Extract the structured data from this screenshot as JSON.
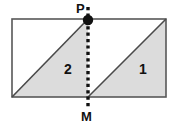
{
  "figure": {
    "type": "geometry-diagram",
    "background_color": "#ffffff",
    "stroke_color": "#4a4a4a",
    "shade_color": "#dcdcdc",
    "dot_color": "#111111",
    "labels": {
      "point_top": "P",
      "point_bottom": "M",
      "region_left": "2",
      "region_right": "1"
    },
    "geometry": {
      "rectangle": {
        "x": 12,
        "y": 19,
        "width": 154,
        "height": 78
      },
      "midline_x": 88,
      "point_P": {
        "x": 88,
        "y": 19
      },
      "point_M": {
        "x": 88,
        "y": 97
      },
      "dotted_line": {
        "x": 88,
        "y_top": 6,
        "y_bottom": 110
      },
      "diagonal_left": {
        "x1": 12,
        "y1": 97,
        "x2": 88,
        "y2": 19
      },
      "diagonal_right": {
        "x1": 88,
        "y1": 97,
        "x2": 166,
        "y2": 19
      },
      "shaded_triangle_left": "12,97 88,97 88,19",
      "shaded_triangle_right": "88,97 166,97 166,19"
    }
  }
}
